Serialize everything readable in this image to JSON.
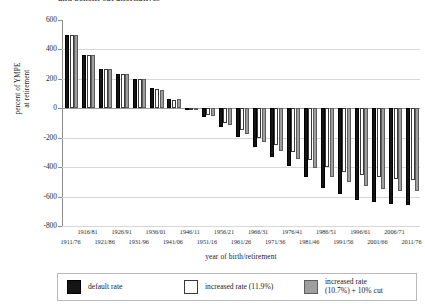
{
  "chart_data": {
    "type": "bar",
    "title": "and benefit cut alternatives",
    "xlabel": "year of birth/retirement",
    "ylabel": "percent of YMPE\nat retirement",
    "ylabel_lines": [
      "percent of YMPE",
      "at retirement"
    ],
    "ylim": [
      -800,
      600
    ],
    "yticks": [
      600,
      400,
      200,
      0,
      -200,
      -400,
      -600,
      -800
    ],
    "ytick_labels": [
      "600",
      "400",
      "200",
      "0",
      "-200",
      "-400",
      "-600",
      "-800"
    ],
    "grid": true,
    "grid_axis": "y",
    "legend_position": "bottom",
    "categories": [
      "1911/76",
      "1916/81",
      "1921/86",
      "1926/91",
      "1931/96",
      "1936/01",
      "1941/06",
      "1946/11",
      "1951/16",
      "1956/21",
      "1961/26",
      "1966/31",
      "1971/36",
      "1976/41",
      "1981/46",
      "1986/51",
      "1991/56",
      "1996/61",
      "2001/66",
      "2006/71",
      "2011/76"
    ],
    "category_rows": [
      1,
      0,
      1,
      0,
      1,
      0,
      1,
      0,
      1,
      0,
      1,
      0,
      1,
      0,
      1,
      0,
      1,
      0,
      1,
      0,
      1
    ],
    "series": [
      {
        "name": "default rate",
        "color": "#141414",
        "values": [
          495,
          360,
          265,
          235,
          200,
          140,
          65,
          5,
          -60,
          -130,
          -195,
          -260,
          -330,
          -395,
          -470,
          -545,
          -580,
          -620,
          -640,
          -650,
          -655
        ]
      },
      {
        "name": "increased rate (11.9%)",
        "color": "#ffffff",
        "values": [
          495,
          360,
          265,
          235,
          200,
          130,
          55,
          -5,
          -45,
          -100,
          -150,
          -200,
          -250,
          -300,
          -350,
          -400,
          -430,
          -455,
          -470,
          -480,
          -485
        ]
      },
      {
        "name": "increased rate (10.7%) + 10% cut",
        "color": "#9e9e9e",
        "values": [
          495,
          360,
          265,
          235,
          200,
          125,
          60,
          0,
          -55,
          -115,
          -175,
          -230,
          -290,
          -345,
          -405,
          -465,
          -500,
          -530,
          -550,
          -560,
          -565
        ]
      }
    ]
  },
  "legend": {
    "entries": [
      {
        "label": "default rate",
        "swatch": "black-swatch"
      },
      {
        "label": "increased rate (11.9%)",
        "swatch": "white-swatch"
      },
      {
        "label": "increased rate\n(10.7%) + 10% cut",
        "swatch": "gray-swatch"
      }
    ]
  }
}
